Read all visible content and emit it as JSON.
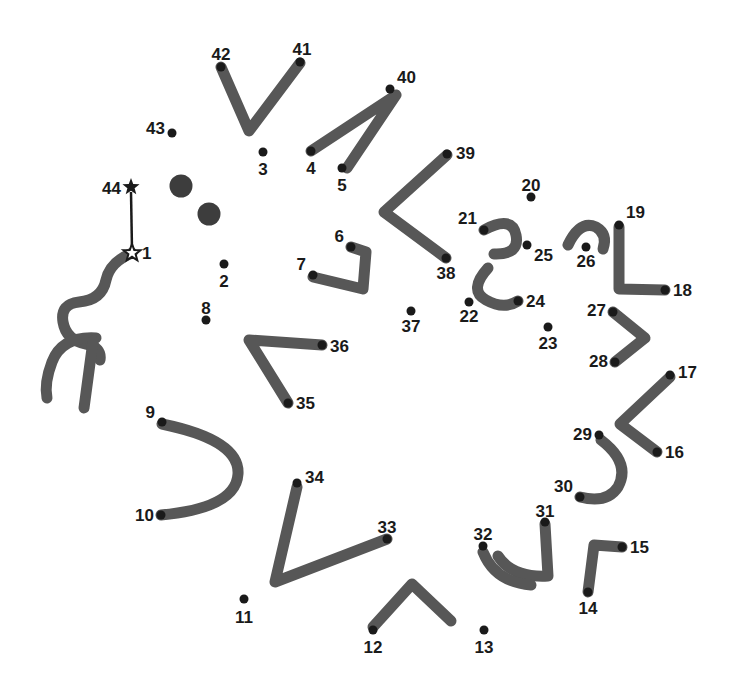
{
  "page": {
    "width": 731,
    "height": 690,
    "background_color": "#ffffff"
  },
  "style": {
    "stroke_color": "#575757",
    "dot_color": "#1a1a1a",
    "label_color": "#1a1a1a",
    "stroke_width": 11,
    "dot_radius": 4.5,
    "big_dot_radius": 11.5,
    "label_font_size": 17
  },
  "puzzle": {
    "total_dots": 44,
    "start_marker": "star-outline",
    "end_marker": "star-filled",
    "start_number": "1",
    "end_number": "44"
  },
  "dots": [
    {
      "n": "1",
      "x": 132,
      "y": 253,
      "marker": "star-outline",
      "lx": 142,
      "ly": 259,
      "anchor": "start"
    },
    {
      "n": "2",
      "x": 224,
      "y": 264,
      "marker": "dot",
      "lx": 224,
      "ly": 287,
      "anchor": "middle"
    },
    {
      "n": "3",
      "x": 263,
      "y": 152,
      "marker": "dot",
      "lx": 263,
      "ly": 175,
      "anchor": "middle"
    },
    {
      "n": "4",
      "x": 311,
      "y": 151,
      "marker": "dot",
      "lx": 311,
      "ly": 174,
      "anchor": "middle"
    },
    {
      "n": "5",
      "x": 342,
      "y": 168,
      "marker": "dot",
      "lx": 342,
      "ly": 191,
      "anchor": "middle"
    },
    {
      "n": "6",
      "x": 351,
      "y": 247,
      "marker": "dot",
      "lx": 344,
      "ly": 242,
      "anchor": "end"
    },
    {
      "n": "7",
      "x": 313,
      "y": 275,
      "marker": "dot",
      "lx": 306,
      "ly": 270,
      "anchor": "end"
    },
    {
      "n": "8",
      "x": 206,
      "y": 320,
      "marker": "dot",
      "lx": 206,
      "ly": 314,
      "anchor": "middle"
    },
    {
      "n": "9",
      "x": 162,
      "y": 422,
      "marker": "dot",
      "lx": 155,
      "ly": 418,
      "anchor": "end"
    },
    {
      "n": "10",
      "x": 161,
      "y": 515,
      "marker": "dot",
      "lx": 154,
      "ly": 521,
      "anchor": "end"
    },
    {
      "n": "11",
      "x": 244,
      "y": 599,
      "marker": "dot",
      "lx": 244,
      "ly": 623,
      "anchor": "middle"
    },
    {
      "n": "12",
      "x": 373,
      "y": 630,
      "marker": "dot",
      "lx": 373,
      "ly": 653,
      "anchor": "middle"
    },
    {
      "n": "13",
      "x": 484,
      "y": 630,
      "marker": "dot",
      "lx": 484,
      "ly": 653,
      "anchor": "middle"
    },
    {
      "n": "14",
      "x": 588,
      "y": 592,
      "marker": "dot",
      "lx": 588,
      "ly": 614,
      "anchor": "middle"
    },
    {
      "n": "15",
      "x": 622,
      "y": 547,
      "marker": "dot",
      "lx": 630,
      "ly": 553,
      "anchor": "start"
    },
    {
      "n": "16",
      "x": 657,
      "y": 452,
      "marker": "dot",
      "lx": 665,
      "ly": 458,
      "anchor": "start"
    },
    {
      "n": "17",
      "x": 670,
      "y": 375,
      "marker": "dot",
      "lx": 678,
      "ly": 378,
      "anchor": "start"
    },
    {
      "n": "18",
      "x": 665,
      "y": 290,
      "marker": "dot",
      "lx": 673,
      "ly": 296,
      "anchor": "start"
    },
    {
      "n": "19",
      "x": 619,
      "y": 225,
      "marker": "dot",
      "lx": 626,
      "ly": 218,
      "anchor": "start"
    },
    {
      "n": "20",
      "x": 531,
      "y": 197,
      "marker": "dot",
      "lx": 531,
      "ly": 191,
      "anchor": "middle"
    },
    {
      "n": "21",
      "x": 484,
      "y": 230,
      "marker": "dot",
      "lx": 477,
      "ly": 224,
      "anchor": "end"
    },
    {
      "n": "22",
      "x": 469,
      "y": 302,
      "marker": "dot",
      "lx": 469,
      "ly": 322,
      "anchor": "middle"
    },
    {
      "n": "23",
      "x": 548,
      "y": 327,
      "marker": "dot",
      "lx": 548,
      "ly": 349,
      "anchor": "middle"
    },
    {
      "n": "24",
      "x": 518,
      "y": 301,
      "marker": "dot",
      "lx": 526,
      "ly": 307,
      "anchor": "start"
    },
    {
      "n": "25",
      "x": 527,
      "y": 245,
      "marker": "dot",
      "lx": 534,
      "ly": 261,
      "anchor": "start"
    },
    {
      "n": "26",
      "x": 586,
      "y": 247,
      "marker": "dot",
      "lx": 586,
      "ly": 267,
      "anchor": "middle"
    },
    {
      "n": "27",
      "x": 613,
      "y": 312,
      "marker": "dot",
      "lx": 606,
      "ly": 316,
      "anchor": "end"
    },
    {
      "n": "28",
      "x": 615,
      "y": 362,
      "marker": "dot",
      "lx": 608,
      "ly": 367,
      "anchor": "end"
    },
    {
      "n": "29",
      "x": 599,
      "y": 435,
      "marker": "dot",
      "lx": 592,
      "ly": 440,
      "anchor": "end"
    },
    {
      "n": "30",
      "x": 580,
      "y": 497,
      "marker": "dot",
      "lx": 573,
      "ly": 492,
      "anchor": "end"
    },
    {
      "n": "31",
      "x": 545,
      "y": 522,
      "marker": "dot",
      "lx": 545,
      "ly": 517,
      "anchor": "middle"
    },
    {
      "n": "32",
      "x": 483,
      "y": 546,
      "marker": "dot",
      "lx": 483,
      "ly": 540,
      "anchor": "middle"
    },
    {
      "n": "33",
      "x": 387,
      "y": 539,
      "marker": "dot",
      "lx": 387,
      "ly": 533,
      "anchor": "middle"
    },
    {
      "n": "34",
      "x": 297,
      "y": 483,
      "marker": "dot",
      "lx": 305,
      "ly": 483,
      "anchor": "start"
    },
    {
      "n": "35",
      "x": 288,
      "y": 403,
      "marker": "dot",
      "lx": 296,
      "ly": 409,
      "anchor": "start"
    },
    {
      "n": "36",
      "x": 322,
      "y": 345,
      "marker": "dot",
      "lx": 330,
      "ly": 352,
      "anchor": "start"
    },
    {
      "n": "37",
      "x": 411,
      "y": 311,
      "marker": "dot",
      "lx": 411,
      "ly": 332,
      "anchor": "middle"
    },
    {
      "n": "38",
      "x": 446,
      "y": 258,
      "marker": "dot",
      "lx": 446,
      "ly": 279,
      "anchor": "middle"
    },
    {
      "n": "39",
      "x": 447,
      "y": 154,
      "marker": "dot",
      "lx": 456,
      "ly": 159,
      "anchor": "start"
    },
    {
      "n": "40",
      "x": 390,
      "y": 89,
      "marker": "dot",
      "lx": 397,
      "ly": 83,
      "anchor": "start"
    },
    {
      "n": "41",
      "x": 300,
      "y": 62,
      "marker": "dot",
      "lx": 302,
      "ly": 55,
      "anchor": "middle"
    },
    {
      "n": "42",
      "x": 221,
      "y": 67,
      "marker": "dot",
      "lx": 221,
      "ly": 60,
      "anchor": "middle"
    },
    {
      "n": "43",
      "x": 172,
      "y": 133,
      "marker": "dot",
      "lx": 165,
      "ly": 134,
      "anchor": "end"
    },
    {
      "n": "44",
      "x": 131,
      "y": 187,
      "marker": "star-filled",
      "lx": 121,
      "ly": 194,
      "anchor": "end"
    }
  ],
  "big_dots": [
    {
      "name": "eye-dot-upper",
      "x": 181,
      "y": 186
    },
    {
      "name": "eye-dot-lower",
      "x": 209,
      "y": 214
    }
  ],
  "guide_line": {
    "name": "start-end-guide",
    "x1": 131,
    "y1": 192,
    "x2": 132,
    "y2": 250
  },
  "strokes": [
    {
      "name": "stroke-42-41",
      "d": "M 221 67 L 249 131 L 300 63"
    },
    {
      "name": "stroke-4-40",
      "d": "M 311 151 L 396 95 L 347 168"
    },
    {
      "name": "stroke-39-38",
      "d": "M 447 155 L 384 212 L 446 258"
    },
    {
      "name": "stroke-6-7",
      "d": "M 351 247 L 366 252 L 363 289 L 313 277"
    },
    {
      "name": "stroke-21-25",
      "d": "M 484 230 Q 512 215 516 235 Q 520 255 494 254"
    },
    {
      "name": "stroke-22-24",
      "d": "M 488 268 Q 468 290 486 300 Q 504 310 518 301"
    },
    {
      "name": "stroke-26-hook",
      "d": "M 568 245 Q 580 220 596 227 Q 608 234 603 249"
    },
    {
      "name": "stroke-19-18",
      "d": "M 619 227 L 619 289 L 665 290"
    },
    {
      "name": "stroke-27-28",
      "d": "M 613 312 L 645 338 L 615 362"
    },
    {
      "name": "stroke-17-16",
      "d": "M 670 377 L 620 424 L 657 452"
    },
    {
      "name": "stroke-29-30",
      "d": "M 601 440 Q 631 463 618 487 Q 607 504 580 497"
    },
    {
      "name": "stroke-31-14",
      "d": "M 545 524 L 548 576 Q 512 578 498 556"
    },
    {
      "name": "stroke-32-small",
      "d": "M 483 552 Q 495 582 531 585"
    },
    {
      "name": "stroke-15-14",
      "d": "M 622 547 L 594 545 L 588 592"
    },
    {
      "name": "stroke-12-13",
      "d": "M 373 627 L 412 584 L 451 621"
    },
    {
      "name": "stroke-34-33",
      "d": "M 297 487 L 275 582 L 387 539"
    },
    {
      "name": "stroke-36-35",
      "d": "M 322 345 L 249 340 L 288 403"
    },
    {
      "name": "stroke-9-10",
      "d": "M 162 424 Q 240 440 238 474 Q 236 508 161 515"
    },
    {
      "name": "stroke-1-squiggle",
      "d": "M 132 253 Q 110 262 106 280 Q 102 300 79 302 Q 60 304 63 322 Q 66 340 86 344 Q 102 347 100 360"
    },
    {
      "name": "stroke-left-fork-a",
      "d": "M 96 338 Q 62 336 52 362 Q 44 383 47 398"
    },
    {
      "name": "stroke-left-fork-b",
      "d": "M 93 341 L 84 408"
    }
  ]
}
